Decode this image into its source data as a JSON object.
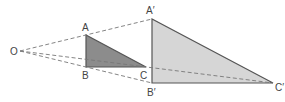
{
  "diagram": {
    "type": "similar-triangles-enlargement",
    "center": {
      "label": "O",
      "x": 18,
      "y": 51
    },
    "small_triangle": {
      "fill": "#8c8c8c",
      "stroke": "#555555",
      "vertices": [
        {
          "label": "A",
          "x": 86,
          "y": 35
        },
        {
          "label": "B",
          "x": 86,
          "y": 67
        },
        {
          "label": "C",
          "x": 146,
          "y": 67
        }
      ]
    },
    "large_triangle": {
      "fill": "#d6d6d6",
      "stroke": "#555555",
      "vertices": [
        {
          "label": "A′",
          "x": 152,
          "y": 19
        },
        {
          "label": "B′",
          "x": 152,
          "y": 83
        },
        {
          "label": "C′",
          "x": 273,
          "y": 83
        }
      ]
    },
    "dashed_color": "#777777"
  },
  "labels": {
    "O": "O",
    "A": "A",
    "B": "B",
    "C": "C",
    "A_prime": "A′",
    "B_prime": "B′",
    "C_prime": "C′"
  }
}
